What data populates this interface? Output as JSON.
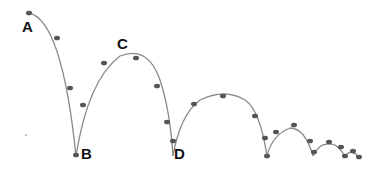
{
  "labels": {
    "A": "A",
    "B": "B",
    "C": "C",
    "D": "D"
  },
  "colors": {
    "path": "#8a8a8a",
    "ball": "#555555",
    "label": "#111111"
  }
}
